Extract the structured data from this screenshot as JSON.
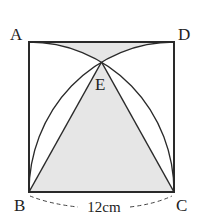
{
  "diagram": {
    "type": "geometry",
    "points": {
      "A": {
        "label": "A"
      },
      "B": {
        "label": "B"
      },
      "C": {
        "label": "C"
      },
      "D": {
        "label": "D"
      },
      "E": {
        "label": "E"
      }
    },
    "dimension_label": "12cm",
    "colors": {
      "stroke": "#2a2a2a",
      "shade": "#e6e6e6",
      "background": "#ffffff"
    }
  }
}
